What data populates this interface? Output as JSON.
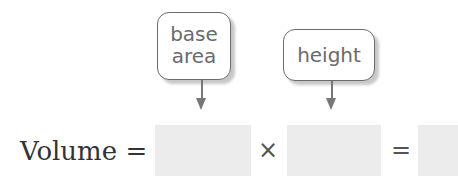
{
  "labels": {
    "base_area_line1": "base",
    "base_area_line2": "area",
    "height": "height"
  },
  "equation": {
    "lhs": "Volume =",
    "times": "×",
    "equals": "="
  },
  "colors": {
    "answer_box": "#ececec",
    "label_border": "#6b6b6b"
  }
}
